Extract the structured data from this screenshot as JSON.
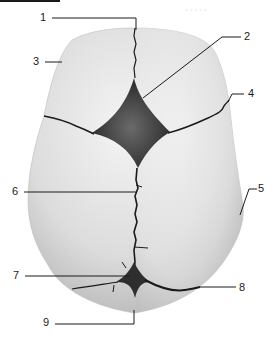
{
  "figure": {
    "colors": {
      "bone_light": "#f2f2f2",
      "bone_mid": "#d4d4d4",
      "bone_shadow": "#a8a8a8",
      "fontanelle": "#3a3a3a",
      "suture": "#1a1a1a",
      "leader": "#1a1a1a",
      "label_text": "#1a1a1a"
    },
    "ghost_text": "·····",
    "labels": [
      {
        "id": "1",
        "text": "1",
        "x": 40,
        "y": 12
      },
      {
        "id": "2",
        "text": "2",
        "x": 244,
        "y": 31
      },
      {
        "id": "3",
        "text": "3",
        "x": 33,
        "y": 56
      },
      {
        "id": "4",
        "text": "4",
        "x": 248,
        "y": 88
      },
      {
        "id": "5",
        "text": "5",
        "x": 258,
        "y": 183
      },
      {
        "id": "6",
        "text": "6",
        "x": 12,
        "y": 186
      },
      {
        "id": "7",
        "text": "7",
        "x": 13,
        "y": 270
      },
      {
        "id": "8",
        "text": "8",
        "x": 239,
        "y": 282
      },
      {
        "id": "9",
        "text": "9",
        "x": 43,
        "y": 317
      }
    ]
  }
}
